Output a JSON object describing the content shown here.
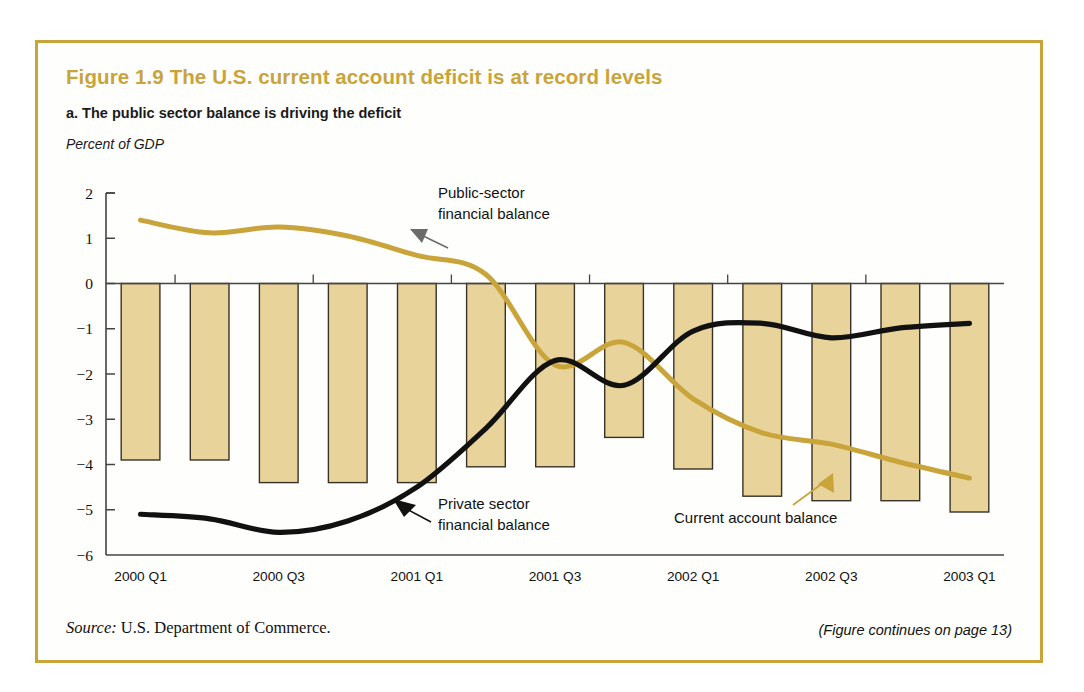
{
  "figure": {
    "title": "Figure 1.9  The U.S. current account deficit is at record levels",
    "panel_subtitle": "a. The public sector balance is driving the deficit",
    "unit_label": "Percent of GDP",
    "source_prefix": "Source:",
    "source_text": " U.S. Department of Commerce.",
    "continues_note": "(Figure continues on page 13)",
    "border_color": "#C9A43B",
    "title_color": "#C9A43B"
  },
  "annotations": {
    "public_sector": {
      "line1": "Public-sector",
      "line2": "financial balance"
    },
    "private_sector": {
      "line1": "Private sector",
      "line2": "financial balance"
    },
    "current_account": {
      "line1": "Current account balance"
    }
  },
  "chart_data": {
    "type": "bar",
    "title": "The U.S. current account deficit is at record levels",
    "subtitle": "a. The public sector balance is driving the deficit",
    "xlabel": "",
    "ylabel": "Percent of GDP",
    "ylim": [
      -6,
      2
    ],
    "yticks": [
      2,
      1,
      0,
      -1,
      -2,
      -3,
      -4,
      -5,
      -6
    ],
    "ytick_labels": [
      "2",
      "1",
      "0",
      "−1",
      "−2",
      "−3",
      "−4",
      "−5",
      "−6"
    ],
    "grid": false,
    "legend": "annotations",
    "x": [
      "2000 Q1",
      "2000 Q2",
      "2000 Q3",
      "2000 Q4",
      "2001 Q1",
      "2001 Q2",
      "2001 Q3",
      "2001 Q4",
      "2002 Q1",
      "2002 Q2",
      "2002 Q3",
      "2002 Q4",
      "2003 Q1"
    ],
    "xtick_labels": [
      "2000 Q1",
      "2000 Q3",
      "2001 Q1",
      "2001 Q3",
      "2002 Q1",
      "2002 Q3",
      "2003 Q1"
    ],
    "xtick_indices": [
      0,
      2,
      4,
      6,
      8,
      10,
      12
    ],
    "series": [
      {
        "name": "Current account balance",
        "kind": "bar",
        "color": "#E8D49A",
        "edge_color": "#3a3226",
        "values": [
          -3.9,
          -3.9,
          -4.4,
          -4.4,
          -4.4,
          -4.05,
          -4.05,
          -3.4,
          -4.1,
          -4.7,
          -4.8,
          -4.8,
          -5.05
        ]
      },
      {
        "name": "Public-sector financial balance",
        "kind": "line",
        "color": "#C9A43B",
        "values": [
          1.4,
          1.12,
          1.25,
          1.05,
          0.62,
          0.2,
          -1.8,
          -1.3,
          -2.55,
          -3.3,
          -3.55,
          -3.95,
          -4.3
        ]
      },
      {
        "name": "Private sector financial balance",
        "kind": "line",
        "color": "#111111",
        "values": [
          -5.1,
          -5.2,
          -5.5,
          -5.25,
          -4.5,
          -3.2,
          -1.7,
          -2.25,
          -1.05,
          -0.88,
          -1.2,
          -0.98,
          -0.88
        ]
      }
    ]
  }
}
